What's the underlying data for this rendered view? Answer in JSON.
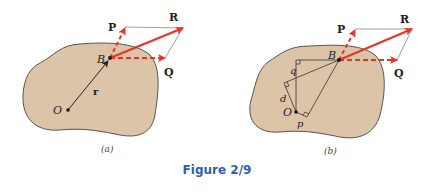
{
  "figure": {
    "caption": "Figure 2/9",
    "caption_color": "#2f5fb3",
    "colors": {
      "body_fill": "#dcc4a8",
      "body_stroke": "#555555",
      "force": "#e8332a",
      "construction": "#333333",
      "parallelogram": "#888888"
    },
    "panels": [
      {
        "sublabel": "(a)",
        "labels": {
          "P": "P",
          "R": "R",
          "Q": "Q",
          "B": "B",
          "O": "O",
          "r": "r"
        }
      },
      {
        "sublabel": "(b)",
        "labels": {
          "P": "P",
          "R": "R",
          "Q": "Q",
          "B": "B",
          "O": "O",
          "q": "q",
          "d": "d",
          "p": "p"
        }
      }
    ]
  }
}
